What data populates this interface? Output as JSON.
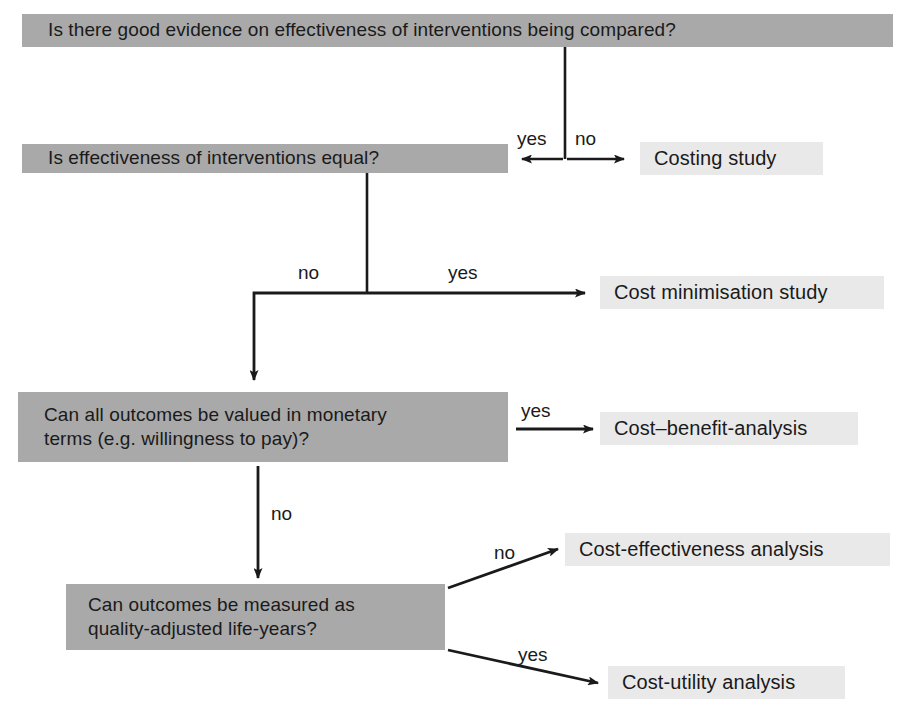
{
  "diagram": {
    "colors": {
      "question_box_bg": "#a9a9a9",
      "result_box_bg": "#e9e9e9",
      "line": "#1a1a1a",
      "text": "#1a1a1a",
      "page_bg": "#ffffff"
    },
    "nodes": {
      "q1": "Is there good evidence on effectiveness of interventions being compared?",
      "q2": "Is effectiveness of interventions equal?",
      "q3": "Can all outcomes be valued in monetary\nterms (e.g. willingness to pay)?",
      "q4": "Can outcomes be measured as\nquality-adjusted life-years?",
      "r1": "Costing study",
      "r2": "Cost minimisation study",
      "r3": "Cost–benefit-analysis",
      "r4": "Cost-effectiveness analysis",
      "r5": "Cost-utility analysis"
    },
    "edge_labels": {
      "e1_yes": "yes",
      "e1_no": "no",
      "e2_no": "no",
      "e2_yes": "yes",
      "e3_yes": "yes",
      "e3_no": "no",
      "e4_no": "no",
      "e4_yes": "yes"
    }
  }
}
